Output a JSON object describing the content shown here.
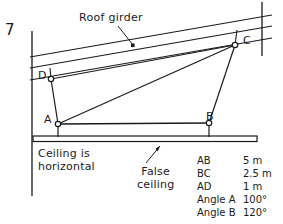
{
  "figure": {
    "number": "7"
  },
  "annotations": {
    "roof_girder": "Roof girder",
    "ceiling_note_line1": "Ceiling is",
    "ceiling_note_line2": "horizontal",
    "false_ceiling_line1": "False",
    "false_ceiling_line2": "ceiling"
  },
  "points": {
    "a": "A",
    "b": "B",
    "c": "C",
    "d": "D"
  },
  "measurements": [
    {
      "name": "AB",
      "value": "5 m"
    },
    {
      "name": "BC",
      "value": "2.5 m"
    },
    {
      "name": "AD",
      "value": "1 m"
    },
    {
      "name": "Angle A",
      "value": "100°"
    },
    {
      "name": "Angle B",
      "value": "120°"
    }
  ],
  "colors": {
    "ink": "#1a1a1a",
    "paper": "#ffffff"
  }
}
